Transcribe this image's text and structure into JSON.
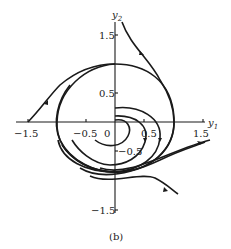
{
  "figure": {
    "caption": "(b)",
    "x_axis_label": "y",
    "x_axis_sub": "1",
    "y_axis_label": "y",
    "y_axis_sub": "2",
    "x_ticks": [
      "−1.5",
      "−0.5",
      "0",
      "0.5",
      "1.5"
    ],
    "y_ticks": [
      "1.5",
      "0.5",
      "−0.5",
      "−1.5"
    ]
  }
}
